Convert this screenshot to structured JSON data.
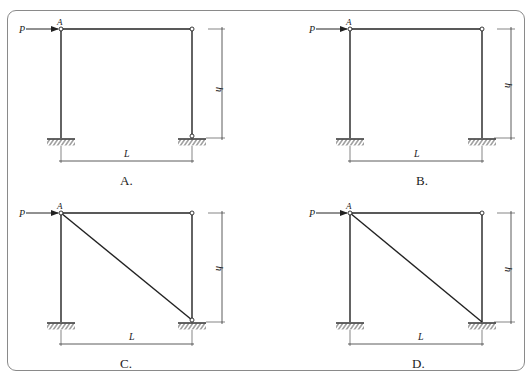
{
  "figure": {
    "type": "structural-frame-options",
    "options": [
      {
        "id": "A",
        "caption": "A.",
        "load_label": "P",
        "node_label": "A",
        "width_label": "L",
        "height_label": "h",
        "joints": {
          "top_left": "hinge",
          "top_right": "hinge",
          "bottom_left": "fixed",
          "bottom_right": "hinge"
        },
        "diagonal": false
      },
      {
        "id": "B",
        "caption": "B.",
        "load_label": "P",
        "node_label": "A",
        "width_label": "L",
        "height_label": "h",
        "joints": {
          "top_left": "hinge",
          "top_right": "hinge",
          "bottom_left": "fixed",
          "bottom_right": "fixed"
        },
        "diagonal": false
      },
      {
        "id": "C",
        "caption": "C.",
        "load_label": "P",
        "node_label": "A",
        "width_label": "L",
        "height_label": "h",
        "joints": {
          "top_left": "hinge",
          "top_right": "hinge",
          "bottom_left": "fixed",
          "bottom_right": "hinge"
        },
        "diagonal": true
      },
      {
        "id": "D",
        "caption": "D.",
        "load_label": "P",
        "node_label": "A",
        "width_label": "L",
        "height_label": "h",
        "joints": {
          "top_left": "hinge",
          "top_right": "hinge",
          "bottom_left": "fixed",
          "bottom_right": "fixed"
        },
        "diagonal": true
      }
    ],
    "colors": {
      "line": "#222222",
      "frame_border": "#8a8a8a",
      "background": "#ffffff"
    }
  }
}
